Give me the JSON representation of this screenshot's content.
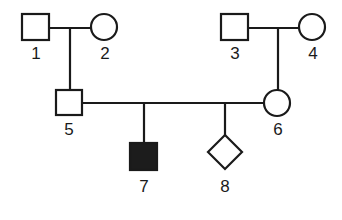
{
  "diagram": {
    "type": "pedigree",
    "individuals": [
      {
        "id": "1",
        "label": "1",
        "sex": "male",
        "affected": false,
        "generation": 1
      },
      {
        "id": "2",
        "label": "2",
        "sex": "female",
        "affected": false,
        "generation": 1
      },
      {
        "id": "3",
        "label": "3",
        "sex": "male",
        "affected": false,
        "generation": 1
      },
      {
        "id": "4",
        "label": "4",
        "sex": "female",
        "affected": false,
        "generation": 1
      },
      {
        "id": "5",
        "label": "5",
        "sex": "male",
        "affected": false,
        "generation": 2,
        "parents": [
          "1",
          "2"
        ]
      },
      {
        "id": "6",
        "label": "6",
        "sex": "female",
        "affected": false,
        "generation": 2,
        "parents": [
          "3",
          "4"
        ]
      },
      {
        "id": "7",
        "label": "7",
        "sex": "male",
        "affected": true,
        "generation": 3,
        "parents": [
          "5",
          "6"
        ]
      },
      {
        "id": "8",
        "label": "8",
        "sex": "unknown",
        "affected": false,
        "generation": 3,
        "parents": [
          "5",
          "6"
        ]
      }
    ],
    "matings": [
      [
        "1",
        "2"
      ],
      [
        "3",
        "4"
      ],
      [
        "5",
        "6"
      ]
    ],
    "colors": {
      "line": "#1a1a1a",
      "affected_fill": "#1c1c1c",
      "unaffected_fill": "#ffffff"
    }
  }
}
